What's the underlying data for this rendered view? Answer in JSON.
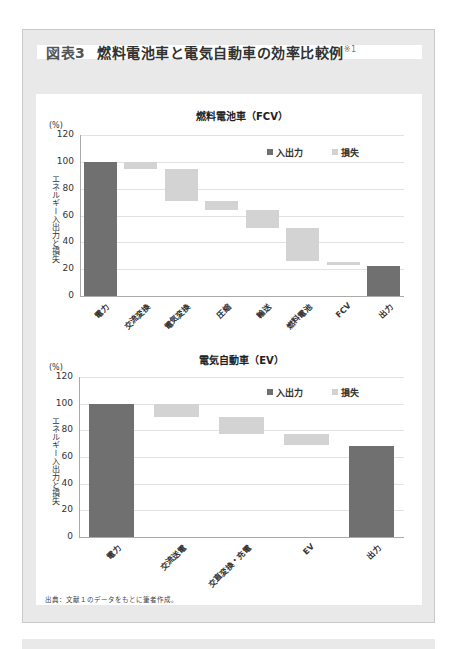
{
  "figure": {
    "number_label": "図表3",
    "title": "燃料電池車と電気自動車の効率比較例",
    "footnote_mark": "※1"
  },
  "legend": {
    "io_label": "入出力",
    "loss_label": "損失"
  },
  "colors": {
    "io": "#707070",
    "loss": "#d3d3d3",
    "frame": "#e9e9e9"
  },
  "source_note": "出典：文献１のデータをもとに筆者作成。",
  "chart_data": [
    {
      "type": "bar",
      "subtype": "waterfall",
      "title": "燃料電池車（FCV）",
      "xlabel": "",
      "ylabel": "エネルギー入出力と損失",
      "unit": "(%)",
      "ylim": [
        0,
        120
      ],
      "yticks": [
        0,
        20,
        40,
        60,
        80,
        100,
        120
      ],
      "grid": true,
      "legend_position": "top-right",
      "legend": [
        "入出力",
        "損失"
      ],
      "categories": [
        "電力",
        "交流変換",
        "電気変換",
        "圧縮",
        "輸送",
        "燃料電池",
        "FCV",
        "出力"
      ],
      "series": [
        {
          "name": "入出力",
          "values": [
            100,
            null,
            null,
            null,
            null,
            null,
            null,
            22
          ]
        },
        {
          "name": "損失",
          "ranges": [
            null,
            [
              95,
              100
            ],
            [
              71,
              95
            ],
            [
              64,
              71
            ],
            [
              51,
              64
            ],
            [
              26,
              51
            ],
            [
              23,
              25
            ],
            null
          ]
        }
      ]
    },
    {
      "type": "bar",
      "subtype": "waterfall",
      "title": "電気自動車（EV）",
      "xlabel": "",
      "ylabel": "エネルギー入出力と損失",
      "unit": "(%)",
      "ylim": [
        0,
        120
      ],
      "yticks": [
        0,
        20,
        40,
        60,
        80,
        100,
        120
      ],
      "grid": true,
      "legend_position": "top-right",
      "legend": [
        "入出力",
        "損失"
      ],
      "categories": [
        "電力",
        "交流送電",
        "交直変換・充電",
        "EV",
        "出力"
      ],
      "series": [
        {
          "name": "入出力",
          "values": [
            100,
            null,
            null,
            null,
            68
          ]
        },
        {
          "name": "損失",
          "ranges": [
            null,
            [
              90,
              100
            ],
            [
              77,
              90
            ],
            [
              69,
              77
            ],
            null
          ]
        }
      ]
    }
  ]
}
